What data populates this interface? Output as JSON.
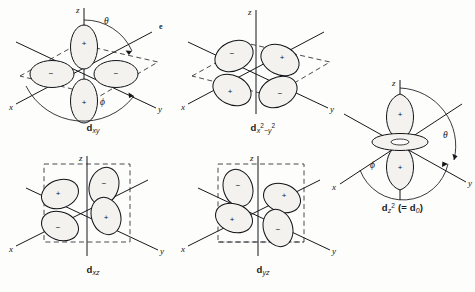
{
  "figure": {
    "kind": "d-orbital angular shape diagrams",
    "stray_mark": "e",
    "background_color": "#fdfdfc",
    "ink_color": "#111316"
  },
  "axis_labels": {
    "x": "x",
    "y": "y",
    "z": "z"
  },
  "angle_labels": {
    "theta": "θ",
    "phi": "ϕ"
  },
  "signs": {
    "positive": "+",
    "negative": "−"
  },
  "orbitals": [
    {
      "id": "dxy",
      "name": "d-xy",
      "label_main": "d",
      "label_sub": "xy",
      "position": {
        "x": 8,
        "y": 4,
        "w": 170,
        "h": 140
      },
      "shows_angles": true,
      "axes": [
        "z",
        "x",
        "y"
      ],
      "lobe_signs": [
        "+",
        "−",
        "−",
        "+"
      ],
      "lobe_layout": "in-plane cloverleaf along x and y, rotated 45°",
      "plane": "xy"
    },
    {
      "id": "dx2-y2",
      "name": "d-x2-y2",
      "label_main": "d",
      "label_sub": "x",
      "label_sup1": "2",
      "label_mid": "−",
      "label_sub2": "y",
      "label_sup2": "2",
      "position": {
        "x": 178,
        "y": 4,
        "w": 170,
        "h": 140
      },
      "shows_angles": false,
      "axes": [
        "z",
        "x",
        "y"
      ],
      "lobe_signs": [
        "−",
        "+",
        "+",
        "−"
      ],
      "lobe_layout": "in-plane cloverleaf aligned on x and y axes",
      "plane": "xy"
    },
    {
      "id": "dz2",
      "name": "d-z2",
      "label_main": "d",
      "label_sub": "z",
      "label_sup1": "2",
      "label_paren": "(= d",
      "label_sub_zero": "0",
      "label_close": ")",
      "position": {
        "x": 330,
        "y": 78,
        "w": 145,
        "h": 150
      },
      "shows_angles": true,
      "axes": [
        "z",
        "x",
        "y"
      ],
      "lobe_signs": [
        "+",
        "+"
      ],
      "lobe_layout": "two lobes along z plus an equatorial torus",
      "has_torus": true,
      "plane": "z"
    },
    {
      "id": "dxz",
      "name": "d-xz",
      "label_main": "d",
      "label_sub": "xz",
      "position": {
        "x": 8,
        "y": 150,
        "w": 170,
        "h": 138
      },
      "shows_angles": false,
      "axes": [
        "z",
        "x",
        "y"
      ],
      "lobe_signs": [
        "+",
        "−",
        "−",
        "+"
      ],
      "lobe_layout": "cloverleaf in the xz plane",
      "plane": "xz"
    },
    {
      "id": "dyz",
      "name": "d-yz",
      "label_main": "d",
      "label_sub": "yz",
      "position": {
        "x": 178,
        "y": 150,
        "w": 170,
        "h": 138
      },
      "shows_angles": false,
      "axes": [
        "z",
        "x",
        "y"
      ],
      "lobe_signs": [
        "−",
        "+",
        "+",
        "−"
      ],
      "lobe_layout": "cloverleaf in the yz plane",
      "plane": "yz"
    }
  ]
}
